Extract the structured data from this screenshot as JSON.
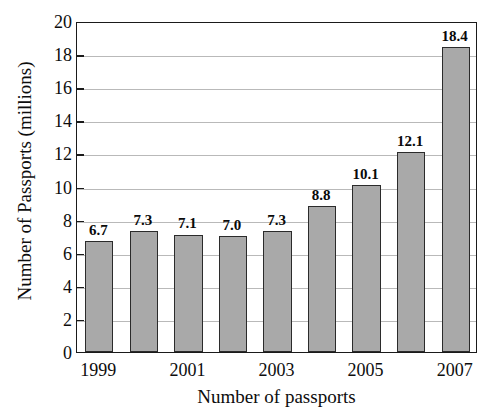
{
  "chart_data": {
    "type": "bar",
    "title": "",
    "xlabel": "Number of passports",
    "ylabel": "Number of Passports (millions)",
    "categories": [
      "1999",
      "2000",
      "2001",
      "2002",
      "2003",
      "2004",
      "2005",
      "2006",
      "2007"
    ],
    "values": [
      6.7,
      7.3,
      7.1,
      7.0,
      7.3,
      8.8,
      10.1,
      12.1,
      18.4
    ],
    "value_labels": [
      "6.7",
      "7.3",
      "7.1",
      "7.0",
      "7.3",
      "8.8",
      "10.1",
      "12.1",
      "18.4"
    ],
    "xtick_labels": [
      "1999",
      "2001",
      "2003",
      "2005",
      "2007"
    ],
    "xtick_categories": [
      "1999",
      "2001",
      "2003",
      "2005",
      "2007"
    ],
    "ylim": [
      0,
      20
    ],
    "ytick_values": [
      0,
      2,
      4,
      6,
      8,
      10,
      12,
      14,
      16,
      18,
      20
    ],
    "ytick_labels": [
      "0",
      "2",
      "4",
      "6",
      "8",
      "10",
      "12",
      "14",
      "16",
      "18",
      "20"
    ],
    "grid": true,
    "grid_axis": "y",
    "legend": false,
    "legend_position": "none",
    "bar_color": "#a9a9a9",
    "bar_edge_color": "#2b2b2b",
    "grid_color": "#b9b9b9",
    "axis_color": "#1a1a1a",
    "background_color": "#ffffff"
  }
}
